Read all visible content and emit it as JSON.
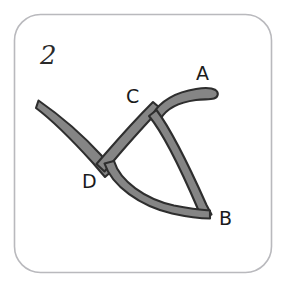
{
  "figure": {
    "number_label": "2",
    "frame": {
      "border_color": "#b9b9bd",
      "background_color": "#ffffff",
      "corner_radius": 26,
      "x": 14,
      "y": 14,
      "width": 258,
      "height": 259
    },
    "stroke_style": {
      "fill_color": "#858585",
      "outline_color": "#2e2e2e",
      "thickness": 11
    },
    "vertices": [
      {
        "id": "A",
        "label": "A",
        "x": 214,
        "y": 95,
        "label_x": 196,
        "label_y": 80
      },
      {
        "id": "B",
        "label": "B",
        "x": 209,
        "y": 212,
        "label_x": 219,
        "label_y": 225
      },
      {
        "id": "C",
        "label": "C",
        "x": 156,
        "y": 112,
        "label_x": 126,
        "label_y": 103
      },
      {
        "id": "D",
        "label": "D",
        "x": 108,
        "y": 165,
        "label_x": 82,
        "label_y": 188
      }
    ],
    "open_endpoints": [
      {
        "id": "left-tail",
        "x": 39,
        "y": 103
      }
    ],
    "edges": [
      {
        "id": "edge-C-A",
        "from": "C",
        "to": "A",
        "shape": "curved"
      },
      {
        "id": "edge-C-B",
        "from": "C",
        "to": "B",
        "shape": "curved"
      },
      {
        "id": "edge-C-D",
        "from": "C",
        "to": "D",
        "shape": "straight"
      },
      {
        "id": "edge-D-B",
        "from": "D",
        "to": "B",
        "shape": "curved-sag"
      },
      {
        "id": "edge-tail-D",
        "from": "left-tail",
        "to": "D",
        "shape": "curved"
      }
    ]
  }
}
